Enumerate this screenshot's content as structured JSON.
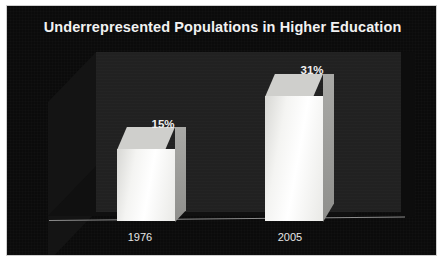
{
  "chart_data": {
    "type": "bar",
    "title": "Underrepresented Populations in Higher Education",
    "categories": [
      "1976",
      "2005"
    ],
    "values": [
      15,
      31
    ],
    "value_labels": [
      "15%",
      "31%"
    ],
    "xlabel": "",
    "ylabel": "",
    "ylim": [
      0,
      40
    ],
    "grid": false,
    "legend": null,
    "style": {
      "background": "#0b0b0b",
      "plot_back_wall": "#212121",
      "bar_face": "#f4f4f2",
      "bar_top": "#cfcfcc",
      "bar_side": "#9a9a97",
      "title_color": "#f2f2f2",
      "label_color": "#e6e6e6",
      "axis_line": "#8c8c8c",
      "frame_border": "#cfcfcf",
      "three_d": true
    }
  }
}
